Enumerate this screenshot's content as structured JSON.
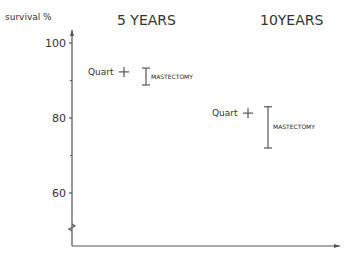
{
  "chart_data": {
    "type": "scatter",
    "title": "",
    "ylabel": "survival %",
    "xlabel": "",
    "ylim": [
      45,
      103
    ],
    "yticks": [
      100,
      80,
      60
    ],
    "groups": [
      {
        "label": "5 YEARS",
        "quart_value": 92.3,
        "quart_label": "Quart",
        "mastectomy_range": [
          88.8,
          93.3
        ],
        "mastectomy_label": "MASTECTOMY"
      },
      {
        "label": "10YEARS",
        "quart_value": 81.3,
        "quart_label": "Quart",
        "mastectomy_range": [
          72,
          83
        ],
        "mastectomy_label": "MASTECTOMY"
      }
    ]
  }
}
